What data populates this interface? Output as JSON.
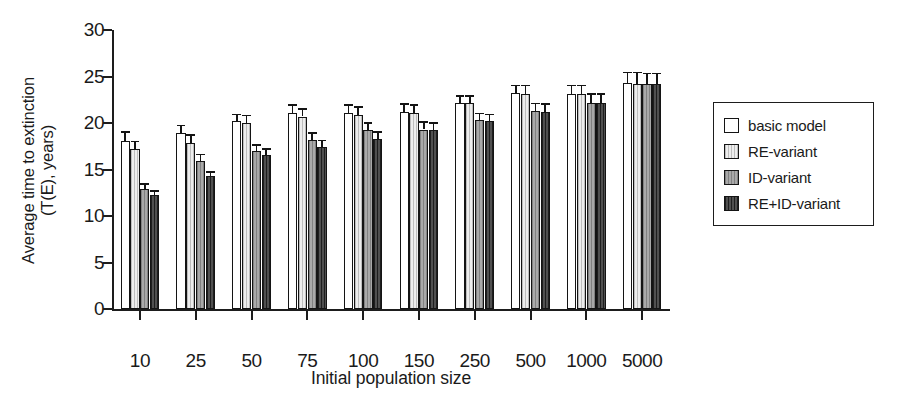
{
  "chart_data": {
    "type": "bar",
    "title": "",
    "subtitle": "",
    "xlabel": "Initial population size",
    "ylabel": "Average time to extinction (T(E), years)",
    "ylabel_line1": "Average time to extinction",
    "ylabel_line2": "(T(E), years)",
    "categories": [
      "10",
      "25",
      "50",
      "75",
      "100",
      "150",
      "250",
      "500",
      "1000",
      "5000"
    ],
    "ylim": [
      0,
      30
    ],
    "yticks": [
      0,
      5,
      10,
      15,
      20,
      25,
      30
    ],
    "ytick_labels": [
      "0",
      "5",
      "10",
      "15",
      "20",
      "25",
      "30"
    ],
    "grid": false,
    "legend_position": "right-outside",
    "series": [
      {
        "name": "basic model",
        "color": "#ffffff",
        "values": [
          18.1,
          18.9,
          20.2,
          21.1,
          21.1,
          21.2,
          22.2,
          23.2,
          23.1,
          24.3
        ],
        "errors": [
          1.0,
          0.9,
          0.8,
          0.9,
          0.9,
          0.9,
          0.8,
          0.9,
          1.0,
          1.2
        ]
      },
      {
        "name": "RE-variant",
        "color": "#ededed",
        "values": [
          17.2,
          17.9,
          20.0,
          20.7,
          20.9,
          21.1,
          22.1,
          23.1,
          23.1,
          24.2
        ],
        "errors": [
          0.9,
          0.9,
          0.9,
          0.9,
          0.9,
          0.9,
          0.9,
          1.0,
          1.0,
          1.3
        ]
      },
      {
        "name": "ID-variant",
        "color": "#a9a9a9",
        "values": [
          12.9,
          15.9,
          17.0,
          18.2,
          19.2,
          19.3,
          20.3,
          21.3,
          22.2,
          24.2
        ],
        "errors": [
          0.6,
          0.8,
          0.7,
          0.8,
          0.9,
          0.9,
          0.8,
          0.9,
          1.0,
          1.2
        ]
      },
      {
        "name": "RE+ID-variant",
        "color": "#3c3c3c",
        "values": [
          12.3,
          14.3,
          16.6,
          17.4,
          18.3,
          19.2,
          20.2,
          21.2,
          22.2,
          24.2
        ],
        "errors": [
          0.5,
          0.5,
          0.7,
          0.8,
          0.8,
          0.9,
          0.8,
          0.9,
          1.0,
          1.2
        ]
      }
    ]
  },
  "legend": {
    "items": [
      {
        "label": "basic model",
        "swatch": "white-square-icon"
      },
      {
        "label": "RE-variant",
        "swatch": "light-gray-square-icon"
      },
      {
        "label": "ID-variant",
        "swatch": "medium-gray-square-icon"
      },
      {
        "label": "RE+ID-variant",
        "swatch": "dark-gray-square-icon"
      }
    ]
  }
}
